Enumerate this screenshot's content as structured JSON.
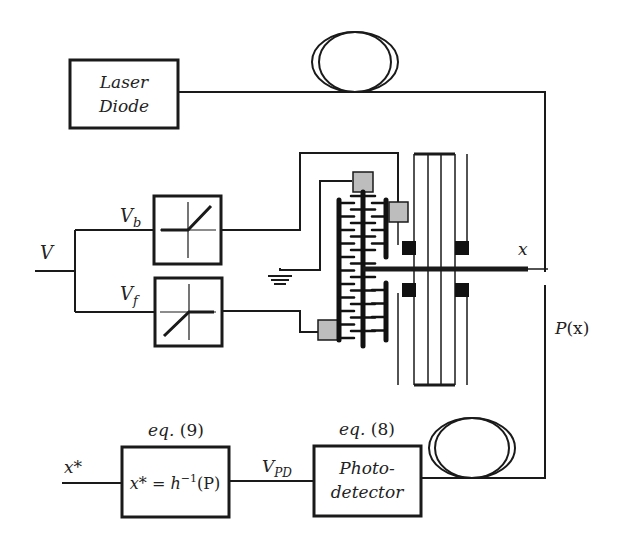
{
  "diagram": {
    "blocks": {
      "laser": {
        "line1": "Laser",
        "line2": "Diode"
      },
      "photodetector": {
        "line1": "Photo-",
        "line2": "detector",
        "eq_label": "eq.",
        "eq_num": "(8)"
      },
      "inverse": {
        "lhs": "x*",
        "eq": "=",
        "fn": "h",
        "exp": "−1",
        "arg": "(P)",
        "eq_label": "eq.",
        "eq_num": "(9)"
      }
    },
    "signals": {
      "input_voltage": "V",
      "backward_voltage": {
        "base": "V",
        "sub": "b"
      },
      "forward_voltage": {
        "base": "V",
        "sub": "f"
      },
      "displacement": "x",
      "optical_power": {
        "fn": "P",
        "arg": "(x)"
      },
      "photodiode_voltage": {
        "base": "V",
        "sub": "PD"
      },
      "estimate_output": "x*"
    },
    "components": [
      "laser-diode",
      "optical-fiber-coil-top",
      "optical-fiber-coil-bottom",
      "rectifier-backward",
      "rectifier-forward",
      "comb-drive",
      "ground",
      "suspension-beams",
      "photodetector",
      "inverse-model-block"
    ]
  }
}
